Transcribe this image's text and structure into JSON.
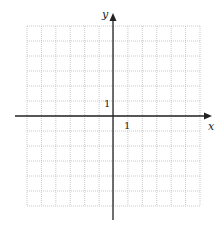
{
  "diagram": {
    "type": "coordinate-plane",
    "x_axis_label": "x",
    "y_axis_label": "y",
    "x_tick_label": "1",
    "y_tick_label": "1",
    "grid": {
      "columns": 12,
      "rows": 12,
      "x_range": [
        -6,
        6
      ],
      "y_range": [
        -6,
        6
      ],
      "style": "dotted",
      "color": "#bbbbbb"
    },
    "axis_color": "#222222"
  }
}
